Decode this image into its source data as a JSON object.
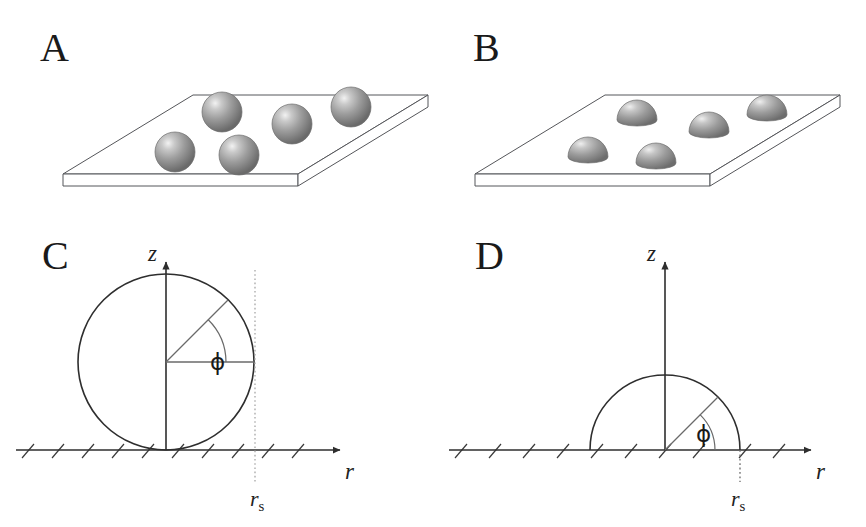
{
  "figure": {
    "background_color": "#ffffff",
    "line_color": "#3a3a3a",
    "text_color": "#1a1a1a",
    "panels": [
      {
        "id": "A",
        "letter": "A",
        "type": "plate-3d",
        "particle_shape": "sphere",
        "particle_count": 5,
        "description": "Tilted flat plate in perspective bearing five full spheres"
      },
      {
        "id": "B",
        "letter": "B",
        "type": "plate-3d",
        "particle_shape": "hemisphere",
        "particle_count": 5,
        "description": "Tilted flat plate in perspective bearing five hemispherical caps"
      },
      {
        "id": "C",
        "letter": "C",
        "type": "cross-section",
        "geometry": "full-circle-tangent-to-surface",
        "axis_z_label": "z",
        "axis_r_label": "r",
        "angle_label": "ϕ",
        "marker_label_base": "r",
        "marker_label_sub": "s",
        "description": "Cross-section of a sphere resting on a hatched surface; z axis through sphere centre, angle phi from horizontal radius, dotted line at r_s tangent to sphere equator"
      },
      {
        "id": "D",
        "letter": "D",
        "type": "cross-section",
        "geometry": "hemisphere-on-surface",
        "axis_z_label": "z",
        "axis_r_label": "r",
        "angle_label": "ϕ",
        "marker_label_base": "r",
        "marker_label_sub": "s",
        "description": "Cross-section of a hemisphere on a hatched surface; z axis through centre, angle phi from r axis, dotted line at r_s where the cap meets the surface"
      }
    ],
    "shared_labels": {
      "z_axis": "z",
      "r_axis": "r",
      "angle": "ϕ",
      "contact_radius_base": "r",
      "contact_radius_sub": "s"
    },
    "colors": {
      "particle_light": "#e6e6e6",
      "particle_mid": "#9a9a9a",
      "particle_dark": "#6e6e6e",
      "plate_face": "#ffffff",
      "stroke": "#3a3a3a",
      "dotted": "#9a9a9a"
    }
  }
}
